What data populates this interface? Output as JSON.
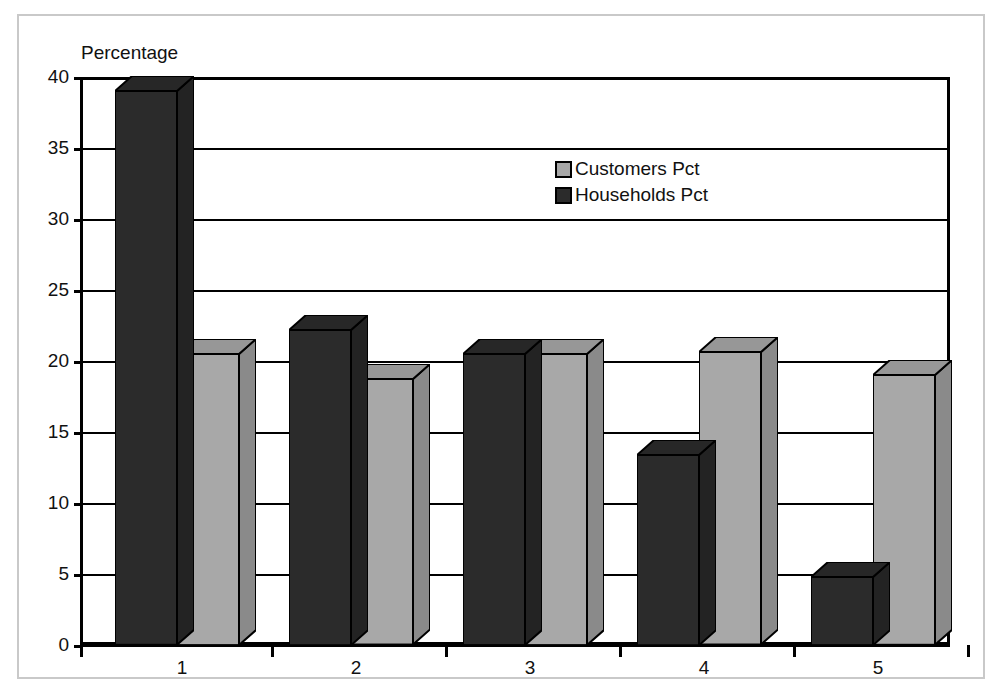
{
  "figure": {
    "axis_unit_label": "Percentage",
    "frame_color": "#c9c9c9",
    "background": "#ffffff"
  },
  "legend": {
    "position": "inside-top-center",
    "items": [
      {
        "label": "Customers Pct",
        "color": "#a8a8a8",
        "swatch_name": "legend-swatch-customers"
      },
      {
        "label": "Households Pct",
        "color": "#2b2b2b",
        "swatch_name": "legend-swatch-households"
      }
    ]
  },
  "chart_data": {
    "type": "bar",
    "title": "",
    "subtitle": "",
    "xlabel": "",
    "ylabel": "Percentage",
    "categories": [
      "1",
      "2",
      "3",
      "4",
      "5"
    ],
    "series": [
      {
        "name": "Households Pct",
        "color": "#2b2b2b",
        "values": [
          39.0,
          22.2,
          20.5,
          13.4,
          4.8
        ]
      },
      {
        "name": "Customers Pct",
        "color": "#a8a8a8",
        "values": [
          20.5,
          18.7,
          20.5,
          20.6,
          19.0
        ]
      }
    ],
    "series_draw_order": [
      "Households Pct",
      "Customers Pct"
    ],
    "ylim": [
      0,
      40
    ],
    "yticks": [
      0,
      5,
      10,
      15,
      20,
      25,
      30,
      35,
      40
    ],
    "ytick_labels": [
      "0",
      "5",
      "10",
      "15",
      "20",
      "25",
      "30",
      "35",
      "40"
    ],
    "grid": true,
    "grid_axis": "y",
    "legend_position": "inside-top-center",
    "style": "3d-blocks",
    "bar_outline_color": "#000000"
  }
}
